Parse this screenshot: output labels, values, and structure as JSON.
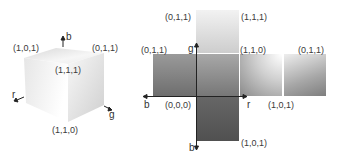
{
  "cube": {
    "vertex_labels": {
      "top_left": "(1,0,1)",
      "top_right": "(0,1,1)",
      "front_top": "(1,1,1)",
      "bottom": "(1,1,0)"
    },
    "axes": {
      "up": "b",
      "left": "r",
      "right": "g"
    }
  },
  "net": {
    "labels": {
      "top_face_left": "(0,1,1)",
      "top_face_right": "(1,1,1)",
      "row_left": "(0,1,1)",
      "center_top_right": "(1,1,0)",
      "right_face": "(0,1,1)",
      "origin": "(0,0,0)",
      "center_bottom_right": "(1,0,1)",
      "bottom_face": "(1,0,1)"
    },
    "axes": {
      "up": "g",
      "left": "b",
      "right": "r",
      "down": "b"
    }
  },
  "colors": {
    "background": "#ffffff",
    "face_light": "#f4f4f4",
    "face_dark": "#5a5a5a",
    "axis_line": "#222222"
  }
}
